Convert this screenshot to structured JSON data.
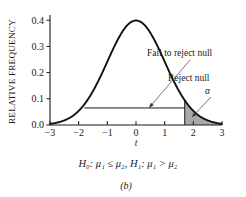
{
  "figure": {
    "caption": "(b)",
    "hypothesis_statement": "H₀: μ₁ ≤ μ₂, H₁: μ₁ > μ₂"
  },
  "chart_data": {
    "type": "line",
    "title": "",
    "subtitle": "",
    "xlabel": "t",
    "ylabel": "RELATIVE FREQUENCY",
    "xlim": [
      -3,
      3
    ],
    "ylim": [
      0.0,
      0.42
    ],
    "grid": false,
    "legend_position": "none",
    "x_ticks": [
      -3,
      -2,
      -1,
      0,
      1,
      2,
      3
    ],
    "x_tick_labels": [
      "−3",
      "−2",
      "−1",
      "0",
      "1",
      "2",
      "3"
    ],
    "y_ticks": [
      0.0,
      0.1,
      0.2,
      0.3,
      0.4
    ],
    "y_tick_labels": [
      "0.0",
      "0.1",
      "0.2",
      "0.3",
      "0.4"
    ],
    "curve": {
      "name": "t distribution (standard normal shape)",
      "peak_x": 0,
      "peak_y": 0.4,
      "x": [
        -3.0,
        -2.8,
        -2.6,
        -2.4,
        -2.2,
        -2.0,
        -1.8,
        -1.6,
        -1.4,
        -1.2,
        -1.0,
        -0.8,
        -0.6,
        -0.4,
        -0.2,
        0.0,
        0.2,
        0.4,
        0.6,
        0.8,
        1.0,
        1.2,
        1.4,
        1.6,
        1.8,
        2.0,
        2.2,
        2.4,
        2.6,
        2.8,
        3.0
      ],
      "y": [
        0.0044,
        0.0079,
        0.0136,
        0.0224,
        0.0355,
        0.054,
        0.079,
        0.1109,
        0.1497,
        0.1942,
        0.242,
        0.2897,
        0.3332,
        0.3683,
        0.391,
        0.3989,
        0.391,
        0.3683,
        0.3332,
        0.2897,
        0.242,
        0.1942,
        0.1497,
        0.1109,
        0.079,
        0.054,
        0.0355,
        0.0224,
        0.0136,
        0.0079,
        0.0044
      ]
    },
    "critical_value": 1.7,
    "rejection_region": {
      "from": 1.7,
      "to": 3.0,
      "fill_color": "#a8a8a8",
      "label": "α"
    },
    "acceptance_span": {
      "from": -1.8,
      "to": 1.7,
      "y": 0.065
    },
    "annotations": [
      {
        "id": "fail-to-reject",
        "text": "Fail to reject null",
        "target_x": 0.45,
        "target_y": 0.065
      },
      {
        "id": "reject",
        "text": "Reject null"
      },
      {
        "id": "alpha",
        "text": "α",
        "target_x": 1.95,
        "target_y": 0.03
      }
    ]
  }
}
